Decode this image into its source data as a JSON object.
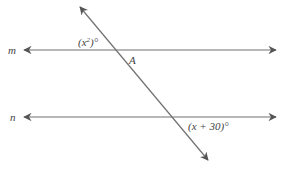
{
  "diagram": {
    "line_m": {
      "label": "m"
    },
    "line_n": {
      "label": "n"
    },
    "transversal": {},
    "angle_top": {
      "text_open": "(x",
      "exp": "2",
      "text_close": ")°"
    },
    "point_a": {
      "label": "A"
    },
    "angle_bottom": {
      "text": "(x + 30)°"
    },
    "colors": {
      "line": "#707070",
      "arrow": "#555555",
      "text": "#444444"
    }
  }
}
